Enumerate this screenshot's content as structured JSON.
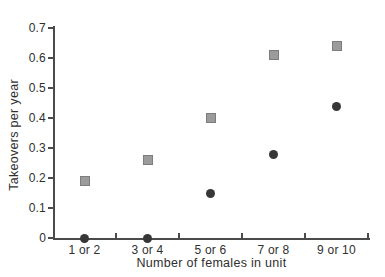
{
  "chart_data": {
    "type": "scatter",
    "title": "",
    "xlabel": "Number of females in unit",
    "ylabel": "Takeovers per year",
    "categories": [
      "1 or 2",
      "3 or 4",
      "5 or 6",
      "7 or 8",
      "9 or 10"
    ],
    "ylim": [
      0,
      0.7
    ],
    "y_ticks": [
      0,
      0.1,
      0.2,
      0.3,
      0.4,
      0.5,
      0.6,
      0.7
    ],
    "y_tick_labels": [
      "0",
      "0.1",
      "0.2",
      "0.3",
      "0.4",
      "0.5",
      "0.6",
      "0.7"
    ],
    "grid": false,
    "legend": "none",
    "series": [
      {
        "name": "square-markers",
        "marker": "square",
        "fill_color": "#9b9b9b",
        "border_color": "#7d7d7d",
        "values": [
          0.19,
          0.26,
          0.4,
          0.61,
          0.64
        ]
      },
      {
        "name": "circle-markers",
        "marker": "circle",
        "fill_color": "#373737",
        "values": [
          0,
          0,
          0.15,
          0.28,
          0.44
        ]
      }
    ],
    "axis_color": "#4b4b4b",
    "text_color": "#2f2f2f",
    "background_color": "#ffffff"
  }
}
